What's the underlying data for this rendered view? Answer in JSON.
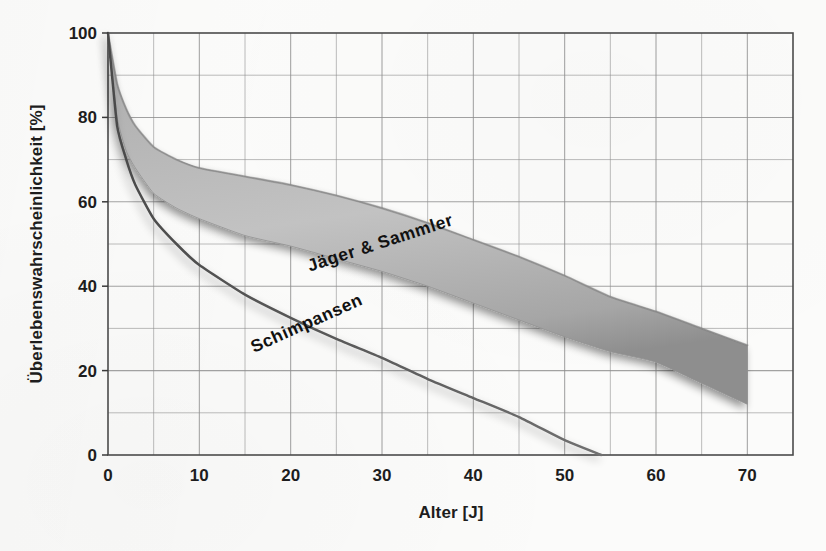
{
  "chart_data": {
    "type": "area",
    "title": "",
    "xlabel": "Alter [J]",
    "ylabel": "Überlebenswahrscheinlichkeit [%]",
    "xlim": [
      0,
      75
    ],
    "ylim": [
      0,
      100
    ],
    "grid": true,
    "x_major_ticks": [
      0,
      10,
      20,
      30,
      40,
      50,
      60,
      70
    ],
    "x_tick_labels": [
      "0",
      "10",
      "20",
      "30",
      "40",
      "50",
      "60",
      "70"
    ],
    "x_minor_tick_step": 5,
    "y_major_ticks": [
      0,
      20,
      40,
      60,
      80,
      100
    ],
    "y_tick_labels": [
      "0",
      "20",
      "40",
      "60",
      "80",
      "100"
    ],
    "y_minor_tick_step": 10,
    "legend": "inline-annotations",
    "annotations": [
      {
        "text": "Jäger & Sammler",
        "x": 30,
        "y": 49,
        "rotation": -18
      },
      {
        "text": "Schimpansen",
        "x": 22,
        "y": 30,
        "rotation": -24
      }
    ],
    "series": [
      {
        "name": "Jäger & Sammler",
        "kind": "band",
        "x": [
          0,
          1,
          2,
          3,
          5,
          7.5,
          10,
          15,
          20,
          25,
          30,
          35,
          40,
          45,
          50,
          55,
          60,
          65,
          70
        ],
        "upper": [
          100,
          88,
          82,
          78,
          73,
          70,
          68,
          66,
          64,
          61.5,
          58.5,
          55,
          51,
          47,
          42.5,
          37.5,
          34,
          30,
          26
        ],
        "lower": [
          100,
          80,
          72,
          68,
          62,
          58.5,
          56,
          52,
          49.5,
          46.5,
          43.5,
          40,
          36,
          32,
          28,
          24.5,
          22,
          17,
          12
        ]
      },
      {
        "name": "Schimpansen",
        "kind": "line",
        "x": [
          0,
          1,
          2,
          3,
          5,
          7.5,
          10,
          15,
          20,
          25,
          30,
          35,
          40,
          45,
          50,
          54
        ],
        "y": [
          100,
          78,
          70,
          64,
          56,
          50,
          45,
          38,
          32.5,
          27.5,
          23,
          18,
          13.5,
          9,
          3.5,
          0
        ]
      }
    ],
    "colors": {
      "band_fill": "#a8a8a8",
      "line": "#5a5a5a",
      "grid": "#8d8d8d",
      "axis": "#3a3a3a",
      "text": "#1d1d1d",
      "background": "#fbfbfa"
    }
  },
  "axes": {
    "x_title": "Alter [J]",
    "y_title": "Überlebenswahrscheinlichkeit [%]"
  },
  "tick_labels": {
    "x": [
      "0",
      "10",
      "20",
      "30",
      "40",
      "50",
      "60",
      "70"
    ],
    "y": [
      "0",
      "20",
      "40",
      "60",
      "80",
      "100"
    ]
  },
  "annotations": {
    "band_label": "Jäger & Sammler",
    "line_label": "Schimpansen"
  }
}
